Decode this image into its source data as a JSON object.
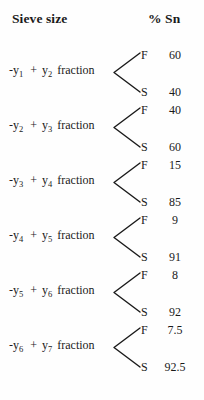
{
  "header": {
    "left_label": "Sieve size",
    "right_label": "% Sn"
  },
  "branch_labels": {
    "top": "F",
    "bottom": "S"
  },
  "colors": {
    "text": "#1a1a1a",
    "background": "#fefefe",
    "line": "#1a1a1a"
  },
  "rows": [
    {
      "term_minus": "-y",
      "sub_minus": "1",
      "operator": "+",
      "term_plus": "y",
      "sub_plus": "2",
      "suffix": "fraction",
      "label_text": "-y1  +  y2  fraction",
      "top_label": "F",
      "top_value": "60",
      "bottom_label": "S",
      "bottom_value": "40"
    },
    {
      "term_minus": "-y",
      "sub_minus": "2",
      "operator": "+",
      "term_plus": "y",
      "sub_plus": "3",
      "suffix": "fraction",
      "label_text": "-y2  +  y3  fraction",
      "top_label": "F",
      "top_value": "40",
      "bottom_label": "S",
      "bottom_value": "60"
    },
    {
      "term_minus": "-y",
      "sub_minus": "3",
      "operator": "+",
      "term_plus": "y",
      "sub_plus": "4",
      "suffix": "fraction",
      "label_text": "-y3  +  y4  fraction",
      "top_label": "F",
      "top_value": "15",
      "bottom_label": "S",
      "bottom_value": "85"
    },
    {
      "term_minus": "-y",
      "sub_minus": "4",
      "operator": "+",
      "term_plus": "y",
      "sub_plus": "5",
      "suffix": "fraction",
      "label_text": "-y4  +  y5  fraction",
      "top_label": "F",
      "top_value": "9",
      "bottom_label": "S",
      "bottom_value": "91"
    },
    {
      "term_minus": "-y",
      "sub_minus": "5",
      "operator": "+",
      "term_plus": "y",
      "sub_plus": "6",
      "suffix": "fraction",
      "label_text": "-y5  +  y6  fraction",
      "top_label": "F",
      "top_value": "8",
      "bottom_label": "S",
      "bottom_value": "92"
    },
    {
      "term_minus": "-y",
      "sub_minus": "6",
      "operator": "+",
      "term_plus": "y",
      "sub_plus": "7",
      "suffix": "fraction",
      "label_text": "-y6  +  y7  fraction",
      "top_label": "F",
      "top_value": "7.5",
      "bottom_label": "S",
      "bottom_value": "92.5"
    }
  ],
  "layout": {
    "row_tops": [
      45,
      100,
      155,
      210,
      265,
      320
    ]
  }
}
